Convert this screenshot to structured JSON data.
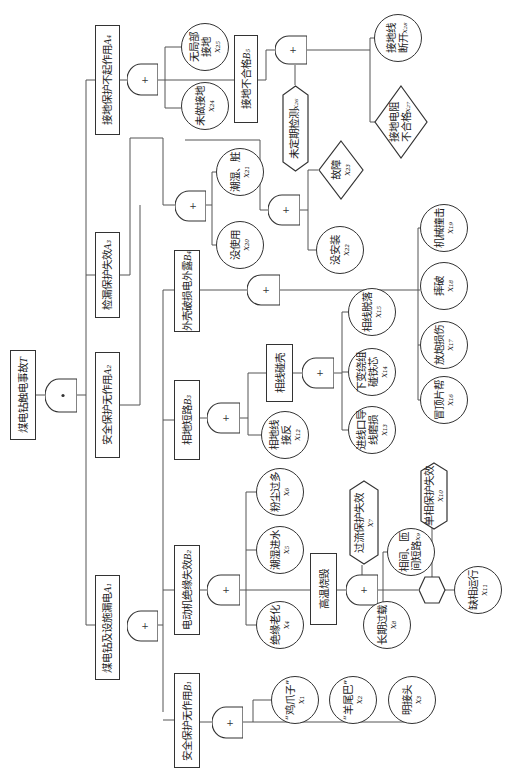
{
  "top_event": {
    "label": "煤电钻触电事故",
    "sym": "T",
    "gate": "AND"
  },
  "intermediate": {
    "A1": {
      "label": "煤电钻及设施漏电",
      "sym": "A₁",
      "gate": "OR"
    },
    "A2": {
      "label": "安全保护无作用",
      "sym": "A₂"
    },
    "A3": {
      "label": "检漏保护失效",
      "sym": "A₃"
    },
    "A4": {
      "label": "接地保护不起作用",
      "sym": "A₄",
      "gate": "OR"
    },
    "B1": {
      "label": "安全保护无作用",
      "sym": "B₁",
      "gate": "OR"
    },
    "B2": {
      "label": "电动机绝缘失效",
      "sym": "B₂",
      "gate": "OR"
    },
    "B3": {
      "label": "相地短路",
      "sym": "B₃",
      "gate": "OR"
    },
    "B4": {
      "label": "外壳破损电外露",
      "sym": "B₄",
      "gate": "OR"
    },
    "B5": {
      "label": "接地不合格",
      "sym": "B₅",
      "gate": "OR"
    },
    "hot": {
      "label": "高温烧毁",
      "gate": "OR"
    },
    "shell": {
      "label": "相线碰壳",
      "gate": "OR"
    }
  },
  "basic_events": {
    "x1": {
      "line1": "“鸡爪子”",
      "line2": "",
      "sym": "x₁"
    },
    "x2": {
      "line1": "“羊尾巴”",
      "line2": "",
      "sym": "x₂"
    },
    "x3": {
      "line1": "明接头",
      "line2": "",
      "sym": "x₃"
    },
    "x4": {
      "line1": "绝缘老化",
      "line2": "",
      "sym": "x₄"
    },
    "x5": {
      "line1": "潮湿进水",
      "line2": "",
      "sym": "x₅"
    },
    "x6": {
      "line1": "粉尘过多",
      "line2": "",
      "sym": "x₆"
    },
    "x8": {
      "line1": "长期过载",
      "line2": "",
      "sym": "x₈"
    },
    "x9": {
      "line1": "相间、匝",
      "line2": "间短路",
      "sym": "x₉"
    },
    "x11": {
      "line1": "缺相运行",
      "line2": "",
      "sym": "x₁₁"
    },
    "x12": {
      "line1": "相地线",
      "line2": "接反",
      "sym": "x₁₂"
    },
    "x13": {
      "line1": "进线口导",
      "line2": "线磨损",
      "sym": "x₁₃"
    },
    "x14": {
      "line1": "下变绕组",
      "line2": "碰铁芯",
      "sym": "x₁₄"
    },
    "x15": {
      "line1": "相线脱落",
      "line2": "",
      "sym": "x₁₅"
    },
    "x16": {
      "line1": "冒顶片帮",
      "line2": "",
      "sym": "x₁₆"
    },
    "x17": {
      "line1": "放炮损伤",
      "line2": "",
      "sym": "x₁₇"
    },
    "x18": {
      "line1": "摔破",
      "line2": "",
      "sym": "x₁₈"
    },
    "x19": {
      "line1": "机械撞击",
      "line2": "",
      "sym": "x₁₉"
    },
    "x20": {
      "line1": "没使用",
      "line2": "",
      "sym": "x₂₀"
    },
    "x21": {
      "line1": "潮湿、脏",
      "line2": "",
      "sym": "x₂₁"
    },
    "x22": {
      "line1": "没安装",
      "line2": "",
      "sym": "x₂₂"
    },
    "x24": {
      "line1": "未做接地",
      "line2": "",
      "sym": "x₂₄"
    },
    "x25": {
      "line1": "无局部",
      "line2": "接地",
      "sym": "x₂₅"
    },
    "x28": {
      "line1": "接地线",
      "line2": "断开",
      "sym": "x₂₈"
    }
  },
  "undeveloped_events": {
    "x23": {
      "label": "故障",
      "sym": "x₂₃"
    },
    "x27": {
      "line1": "接地电阻",
      "line2": "不合格",
      "sym": "x₂₇"
    }
  },
  "conditions": {
    "x7": {
      "label": "过流保护失效",
      "sym": "x₇"
    },
    "x10": {
      "label": "单相保护失效",
      "sym": "x₁₀"
    },
    "x26": {
      "label": "未定期检测",
      "sym": "x₂₆"
    }
  },
  "gate_symbols": {
    "and": "•",
    "or": "+"
  },
  "colors": {
    "line": "#555555",
    "stroke": "#333333",
    "background": "#ffffff"
  }
}
